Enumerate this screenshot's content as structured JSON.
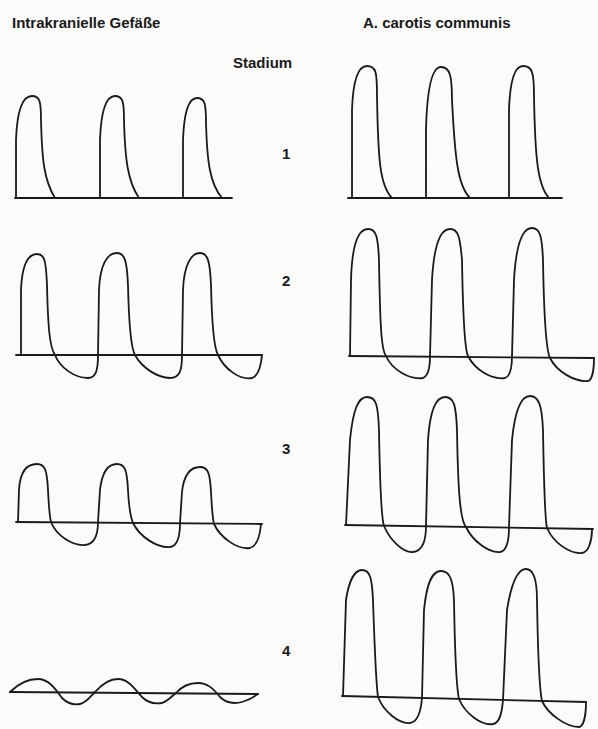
{
  "titles": {
    "left": "Intrakranielle Gefäße",
    "right": "A. carotis communis",
    "center": "Stadium"
  },
  "stages": [
    {
      "number": "1",
      "left_waveform": "systolic peaks, no diastolic flow",
      "right_waveform": "systolic peaks, no reverse flow"
    },
    {
      "number": "2",
      "left_waveform": "systolic peaks with diastolic flow reversal",
      "right_waveform": "systolic peaks with diastolic flow reversal"
    },
    {
      "number": "3",
      "left_waveform": "reduced systolic peaks with diastolic flow reversal",
      "right_waveform": "systolic peaks with diastolic flow reversal"
    },
    {
      "number": "4",
      "left_waveform": "small oscillating (to-and-fro) flow",
      "right_waveform": "systolic peaks with diastolic flow reversal"
    }
  ],
  "colors": {
    "ink": "#1a1a1a",
    "paper": "#fbfbfa"
  }
}
